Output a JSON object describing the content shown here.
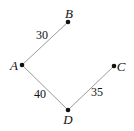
{
  "diagram": {
    "type": "weighted-graph",
    "colors": {
      "edge": "#9a9a9a",
      "node": "#111111",
      "text": "#111111",
      "background": "#ffffff"
    },
    "nodes": [
      {
        "id": "A",
        "label": "A",
        "x": 22,
        "y": 65,
        "label_x": 14,
        "label_y": 70
      },
      {
        "id": "B",
        "label": "B",
        "x": 68,
        "y": 22,
        "label_x": 69,
        "label_y": 18
      },
      {
        "id": "C",
        "label": "C",
        "x": 114,
        "y": 66,
        "label_x": 121,
        "label_y": 71
      },
      {
        "id": "D",
        "label": "D",
        "x": 68,
        "y": 110,
        "label_x": 68,
        "label_y": 124
      }
    ],
    "edges": [
      {
        "from": "A",
        "to": "B",
        "weight": "30",
        "label_x": 42,
        "label_y": 39
      },
      {
        "from": "A",
        "to": "D",
        "weight": "40",
        "label_x": 40,
        "label_y": 98
      },
      {
        "from": "D",
        "to": "C",
        "weight": "35",
        "label_x": 97,
        "label_y": 96
      }
    ]
  }
}
